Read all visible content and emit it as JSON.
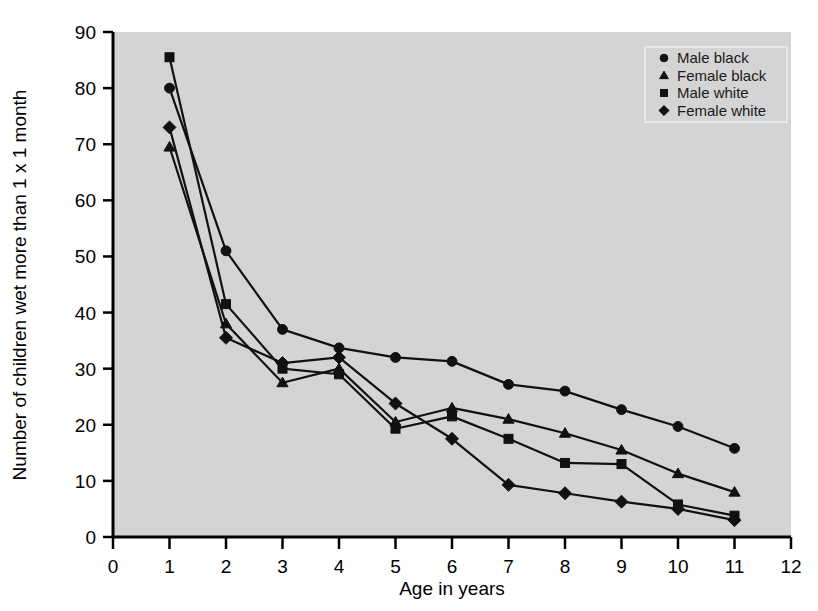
{
  "chart_data": {
    "type": "line",
    "title": "",
    "xlabel": "Age in years",
    "ylabel": "Number of children wet more than 1 x 1 month",
    "xlim": [
      0,
      12
    ],
    "ylim": [
      0,
      90
    ],
    "xticks": [
      0,
      1,
      2,
      3,
      4,
      5,
      6,
      7,
      8,
      9,
      10,
      11,
      12
    ],
    "yticks": [
      0,
      10,
      20,
      30,
      40,
      50,
      60,
      70,
      80,
      90
    ],
    "grid": false,
    "legend_position": "top-right",
    "plot_background": "#d4d4d4",
    "line_color": "#111111",
    "x": [
      1,
      2,
      3,
      4,
      5,
      6,
      7,
      8,
      9,
      10,
      11
    ],
    "series": [
      {
        "name": "Male black",
        "marker": "circle",
        "values": [
          80,
          51,
          37,
          33.7,
          32,
          31.3,
          27.2,
          26,
          22.7,
          19.7,
          15.8
        ]
      },
      {
        "name": "Female black",
        "marker": "triangle",
        "values": [
          69.5,
          38,
          27.5,
          30,
          20.5,
          23,
          21,
          18.5,
          15.5,
          11.3,
          8
        ]
      },
      {
        "name": "Male white",
        "marker": "square",
        "values": [
          85.5,
          41.5,
          30,
          29,
          19.3,
          21.5,
          17.5,
          13.2,
          13,
          5.8,
          3.8
        ]
      },
      {
        "name": "Female white",
        "marker": "diamond",
        "values": [
          73,
          35.5,
          31,
          32,
          23.8,
          17.5,
          9.3,
          7.8,
          6.3,
          5,
          3
        ]
      }
    ]
  },
  "legend": {
    "items": [
      {
        "label": "Male black",
        "marker": "circle"
      },
      {
        "label": "Female black",
        "marker": "triangle"
      },
      {
        "label": "Male white",
        "marker": "square"
      },
      {
        "label": "Female white",
        "marker": "diamond"
      }
    ]
  },
  "axes": {
    "x_title": "Age in years",
    "y_title": "Number of children wet more than 1 x 1 month"
  }
}
